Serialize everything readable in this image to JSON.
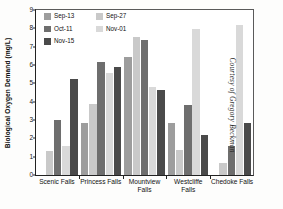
{
  "credit": "Courtesy of Gregory Beckman",
  "legend": {
    "items": [
      {
        "label": "Sep-13",
        "color": "#9d9d9d"
      },
      {
        "label": "Sep-27",
        "color": "#c9c9c9"
      },
      {
        "label": "Oct-11",
        "color": "#6e6e6e"
      },
      {
        "label": "Nov-01",
        "color": "#d9d9d9"
      },
      {
        "label": "Nov-15",
        "color": "#4a4a4a"
      }
    ]
  },
  "chart_data": {
    "type": "bar",
    "title": "",
    "xlabel": "",
    "ylabel": "Biological Oxygen Demand (mg/L)",
    "ylim": [
      0,
      9
    ],
    "yticks": [
      0,
      1,
      2,
      3,
      4,
      5,
      6,
      7,
      8,
      9
    ],
    "ytick_labels": [
      "0",
      "1",
      "2",
      "3",
      "4",
      "5",
      "6",
      "7",
      "8",
      "9"
    ],
    "grid": false,
    "legend_position": "top-left-inside",
    "categories": [
      "Scenic Falls",
      "Princess Falls",
      "Mountview\nFalls",
      "Westcliffe\nFalls",
      "Chedoke Falls"
    ],
    "series": [
      {
        "name": "Sep-13",
        "color": "#9d9d9d",
        "values": [
          null,
          2.85,
          6.45,
          2.85,
          null
        ]
      },
      {
        "name": "Sep-27",
        "color": "#c9c9c9",
        "values": [
          1.3,
          3.85,
          7.55,
          1.35,
          0.65
        ]
      },
      {
        "name": "Oct-11",
        "color": "#6e6e6e",
        "values": [
          2.98,
          6.15,
          7.35,
          3.8,
          1.6
        ]
      },
      {
        "name": "Nov-01",
        "color": "#d9d9d9",
        "values": [
          1.6,
          5.55,
          4.8,
          7.95,
          8.2
        ]
      },
      {
        "name": "Nov-15",
        "color": "#4a4a4a",
        "values": [
          5.25,
          5.9,
          4.65,
          2.18,
          2.85
        ]
      }
    ]
  }
}
